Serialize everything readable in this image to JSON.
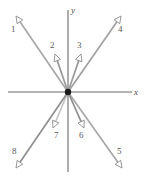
{
  "figure": {
    "width": 147,
    "height": 181,
    "background": "#ffffff",
    "origin": {
      "x": 68,
      "y": 92
    },
    "dot_color": "#1a1a1a",
    "dot_radius": 3.2
  },
  "axes": {
    "color": "#6b6b6b",
    "stroke_width": 1.1,
    "x_axis": {
      "label": "x",
      "x1": 8,
      "y1": 92,
      "x2": 132,
      "y2": 92,
      "label_x": 134,
      "label_y": 88
    },
    "y_axis": {
      "label": "y",
      "x1": 68,
      "y1": 10,
      "x2": 68,
      "y2": 172,
      "label_x": 71,
      "label_y": 6
    }
  },
  "vectors": [
    {
      "id": "1",
      "label": "1",
      "x1": 68,
      "y1": 92,
      "x2": 16,
      "y2": 16,
      "color": "#a8a8a8",
      "stroke_width": 1.7,
      "label_x": 11,
      "label_y": 25
    },
    {
      "id": "2",
      "label": "2",
      "x1": 68,
      "y1": 92,
      "x2": 55,
      "y2": 54,
      "color": "#9a9a9a",
      "stroke_width": 1.7,
      "label_x": 50,
      "label_y": 41
    },
    {
      "id": "3",
      "label": "3",
      "x1": 68,
      "y1": 92,
      "x2": 81,
      "y2": 54,
      "color": "#9a9a9a",
      "stroke_width": 1.7,
      "label_x": 77,
      "label_y": 41
    },
    {
      "id": "4",
      "label": "4",
      "x1": 68,
      "y1": 92,
      "x2": 121,
      "y2": 16,
      "color": "#a0a0a0",
      "stroke_width": 1.7,
      "label_x": 118,
      "label_y": 25
    },
    {
      "id": "5",
      "label": "5",
      "x1": 68,
      "y1": 92,
      "x2": 122,
      "y2": 168,
      "color": "#a8a8a8",
      "stroke_width": 1.7,
      "label_x": 117,
      "label_y": 147
    },
    {
      "id": "6",
      "label": "6",
      "x1": 68,
      "y1": 92,
      "x2": 84,
      "y2": 128,
      "color": "#8f8f8f",
      "stroke_width": 1.7,
      "label_x": 79,
      "label_y": 131
    },
    {
      "id": "7",
      "label": "7",
      "x1": 68,
      "y1": 92,
      "x2": 53,
      "y2": 128,
      "color": "#c5c5c5",
      "stroke_width": 1.7,
      "label_x": 54,
      "label_y": 131
    },
    {
      "id": "8",
      "label": "8",
      "x1": 68,
      "y1": 92,
      "x2": 16,
      "y2": 168,
      "color": "#8f8f8f",
      "stroke_width": 1.7,
      "label_x": 12,
      "label_y": 147
    }
  ],
  "arrowhead": {
    "style": "open-triangle",
    "length": 7,
    "half_width": 3.4,
    "fill": "#ffffff",
    "stroke": "#8a8a8a",
    "stroke_width": 0.9
  }
}
